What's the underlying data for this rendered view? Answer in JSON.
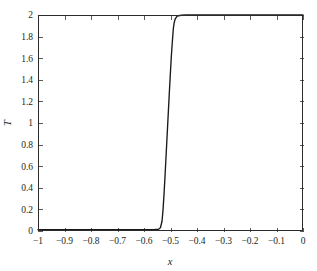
{
  "chart_data": {
    "type": "line",
    "title": "",
    "subtitle": "",
    "xlabel": "x",
    "ylabel": "T",
    "xlim": [
      -1,
      0
    ],
    "ylim": [
      0,
      2
    ],
    "grid": false,
    "legend": null,
    "xticks": [
      -1,
      -0.9,
      -0.8,
      -0.7,
      -0.6,
      -0.5,
      -0.4,
      -0.3,
      -0.2,
      -0.1,
      0
    ],
    "xtick_labels": [
      "-1",
      "-0.9",
      "-0.8",
      "-0.7",
      "-0.6",
      "-0.5",
      "-0.4",
      "-0.3",
      "-0.2",
      "-0.1",
      "0"
    ],
    "yticks": [
      0,
      0.2,
      0.4,
      0.6,
      0.8,
      1,
      1.2,
      1.4,
      1.6,
      1.8,
      2
    ],
    "ytick_labels": [
      "0",
      "0.2",
      "0.4",
      "0.6",
      "0.8",
      "1",
      "1.2",
      "1.4",
      "1.6",
      "1.8",
      "2"
    ],
    "series": [
      {
        "name": "T(x)",
        "color": "#1a1a1a",
        "linewidth": 1.35,
        "x": [
          -1.0,
          -0.95,
          -0.9,
          -0.85,
          -0.8,
          -0.75,
          -0.7,
          -0.65,
          -0.6,
          -0.58,
          -0.56,
          -0.545,
          -0.538,
          -0.532,
          -0.528,
          -0.524,
          -0.52,
          -0.516,
          -0.512,
          -0.508,
          -0.504,
          -0.5,
          -0.497,
          -0.494,
          -0.491,
          -0.489,
          -0.486,
          -0.482,
          -0.475,
          -0.46,
          -0.44,
          -0.4,
          -0.35,
          -0.3,
          -0.25,
          -0.2,
          -0.15,
          -0.1,
          -0.05,
          0.0
        ],
        "y": [
          0.012,
          0.012,
          0.012,
          0.012,
          0.012,
          0.012,
          0.012,
          0.012,
          0.013,
          0.013,
          0.014,
          0.016,
          0.03,
          0.09,
          0.2,
          0.36,
          0.54,
          0.73,
          0.92,
          1.11,
          1.3,
          1.48,
          1.61,
          1.72,
          1.82,
          1.88,
          1.93,
          1.965,
          1.99,
          1.998,
          2.0,
          2.0,
          2.0,
          2.0,
          2.0,
          2.0,
          2.0,
          2.0,
          2.0,
          2.0
        ]
      }
    ],
    "axes_geometry": {
      "plot_left_px": 38,
      "plot_right_px": 303,
      "plot_top_px": 15,
      "plot_bottom_px": 231,
      "tick_length_px": 4,
      "tick_direction": "in"
    },
    "colors": {
      "background": "#ffffff",
      "frame": "#2b2b2b",
      "text": "#231f20",
      "curve": "#1a1a1a"
    }
  }
}
